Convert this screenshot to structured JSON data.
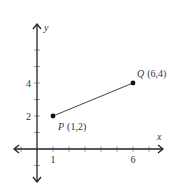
{
  "diagram": {
    "type": "coordinate-plane",
    "axes": {
      "x_label": "x",
      "y_label": "y",
      "x_range": [
        -1.5,
        8
      ],
      "y_range": [
        -2,
        6.5
      ],
      "x_ticks": [
        -1,
        1,
        2,
        3,
        4,
        5,
        6,
        7
      ],
      "y_ticks": [
        -1,
        1,
        2,
        3,
        4,
        5,
        6
      ],
      "x_tick_labels": [
        {
          "value": 1,
          "text": "1"
        },
        {
          "value": 6,
          "text": "6"
        }
      ],
      "y_tick_labels": [
        {
          "value": 2,
          "text": "2"
        },
        {
          "value": 4,
          "text": "4"
        }
      ]
    },
    "points": [
      {
        "name": "P",
        "coords_text": "(1,2)",
        "x": 1,
        "y": 2
      },
      {
        "name": "Q",
        "coords_text": "(6,4)",
        "x": 6,
        "y": 4
      }
    ],
    "segments": [
      {
        "from": "P",
        "to": "Q"
      }
    ]
  }
}
